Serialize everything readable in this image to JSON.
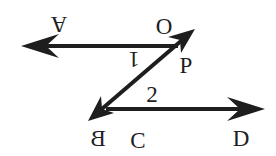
{
  "diagram": {
    "type": "geometry-parallel-lines-transversal",
    "colors": {
      "stroke": "#1e1e1e",
      "background": "#ffffff"
    },
    "labels": {
      "A": "A",
      "O": "O",
      "P": "P",
      "B": "B",
      "C": "C",
      "D": "D",
      "angle1": "1",
      "angle2": "2"
    },
    "rays": [
      {
        "name": "ray-PA",
        "from": "P",
        "toward": "A",
        "direction": "left"
      },
      {
        "name": "ray-PO",
        "from": "P",
        "toward": "O",
        "direction": "up-right"
      },
      {
        "name": "ray-PB",
        "from": "P",
        "toward": "B",
        "direction": "down-left"
      },
      {
        "name": "ray-CD",
        "from": "C",
        "toward": "D",
        "direction": "right"
      }
    ],
    "angles": [
      {
        "label": "1",
        "between": [
          "ray-PA",
          "ray-PB"
        ],
        "vertex": "P"
      },
      {
        "label": "2",
        "between": [
          "ray-PB",
          "ray-CD"
        ],
        "vertex": "B"
      }
    ]
  }
}
